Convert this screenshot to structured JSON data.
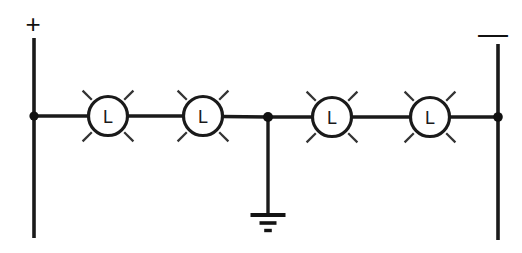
{
  "diagram": {
    "background_color": "#ffffff",
    "line_color": "#1a1a1a",
    "width": 522,
    "height": 253
  },
  "polarity": {
    "positive_label": "+",
    "negative_label": "—"
  },
  "rails": {
    "left": {
      "x": 34,
      "y_top": 38,
      "y_bottom": 238
    },
    "right": {
      "x": 498,
      "y_top": 44,
      "y_bottom": 240
    }
  },
  "bus": {
    "y": 117,
    "x_start": 34,
    "x_end": 498
  },
  "nodes": [
    {
      "name": "left-rail-node",
      "x": 34,
      "y": 116,
      "r": 4.6
    },
    {
      "name": "center-ground-node",
      "x": 268,
      "y": 117,
      "r": 5.0
    },
    {
      "name": "right-rail-node",
      "x": 498,
      "y": 117,
      "r": 4.8
    }
  ],
  "lamps": [
    {
      "id": "lamp-1",
      "label": "L",
      "cx": 108,
      "cy": 116,
      "r": 19.5
    },
    {
      "id": "lamp-2",
      "label": "L",
      "cx": 203,
      "cy": 116,
      "r": 19.5
    },
    {
      "id": "lamp-3",
      "label": "L",
      "cx": 332,
      "cy": 117,
      "r": 19.5
    },
    {
      "id": "lamp-4",
      "label": "L",
      "cx": 430,
      "cy": 117,
      "r": 19.5
    }
  ],
  "ground": {
    "label": "earth-ground",
    "x": 268,
    "y_top": 117,
    "y_bottom": 214,
    "bars": [
      {
        "half_width": 17.5,
        "y": 215,
        "thickness": 3.6
      },
      {
        "half_width": 8.5,
        "y": 223,
        "thickness": 3.4
      },
      {
        "half_width": 3.8,
        "y": 230,
        "thickness": 3.2
      }
    ]
  },
  "labels": {
    "plus": {
      "x": 33,
      "y": 24
    },
    "minus": {
      "x": 493,
      "y": 33
    }
  },
  "rays": {
    "inner_offset": 5,
    "length": 13,
    "angles_deg": [
      45,
      135,
      225,
      315
    ]
  }
}
